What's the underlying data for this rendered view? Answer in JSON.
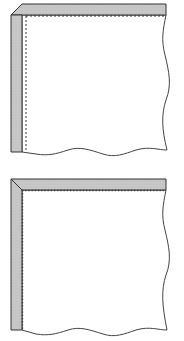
{
  "diagram": {
    "colors": {
      "fabric": "#ffffff",
      "binding": "#c8c8c8",
      "outline": "#333333",
      "stitch": "#333333"
    },
    "figures": [
      {
        "id": "top",
        "corner_style": "lapped",
        "stitch_style": "dashed"
      },
      {
        "id": "bottom",
        "corner_style": "mitered",
        "stitch_style": "beaded"
      }
    ]
  }
}
